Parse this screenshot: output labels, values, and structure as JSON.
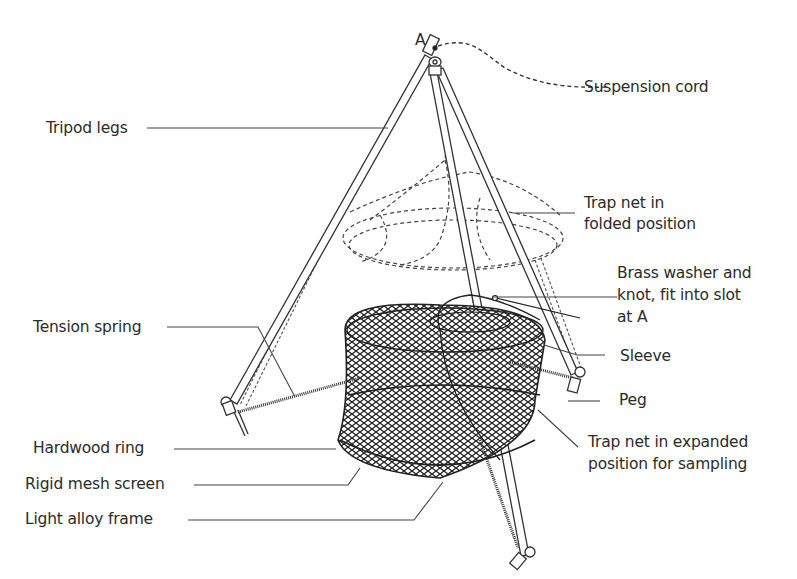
{
  "diagram": {
    "type": "labeled-illustration",
    "point_marker": "A",
    "labels": {
      "suspension_cord": "Suspension cord",
      "tripod_legs": "Tripod legs",
      "trap_net_folded_1": "Trap net in",
      "trap_net_folded_2": "folded position",
      "brass_washer_1": "Brass washer and",
      "brass_washer_2": "knot, fit into slot",
      "brass_washer_3": "at A",
      "tension_spring": "Tension spring",
      "sleeve": "Sleeve",
      "peg": "Peg",
      "hardwood_ring": "Hardwood ring",
      "trap_net_expanded_1": "Trap net in expanded",
      "trap_net_expanded_2": "position for sampling",
      "rigid_mesh_screen": "Rigid mesh screen",
      "light_alloy_frame": "Light alloy frame"
    },
    "colors": {
      "line": "#333333",
      "background": "#ffffff"
    }
  }
}
